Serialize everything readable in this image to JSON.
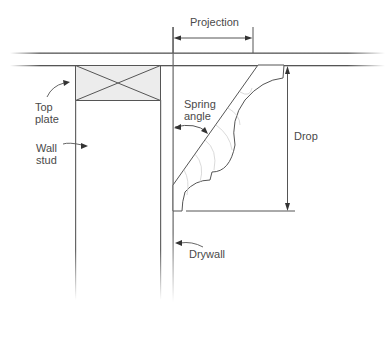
{
  "diagram": {
    "labels": {
      "projection": "Projection",
      "spring_angle": "Spring\nangle",
      "drop": "Drop",
      "top_plate": "Top\nplate",
      "wall_stud": "Wall\nstud",
      "drywall": "Drywall"
    },
    "colors": {
      "line": "#555555",
      "top_plate_fill": "#ececec",
      "text": "#4a4a4a"
    }
  }
}
